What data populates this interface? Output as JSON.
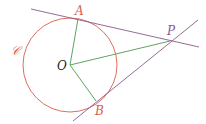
{
  "diagram": {
    "colors": {
      "circle": "#d9604a",
      "tangent": "#8a5a8a",
      "radius": "#4e9a4e",
      "label_red": "#d9604a",
      "label_dark": "#222222"
    },
    "circle": {
      "label": "𝒞",
      "cx": 70,
      "cy": 65,
      "r": 47
    },
    "points": {
      "O": {
        "label": "O",
        "x": 70,
        "y": 65
      },
      "A": {
        "label": "A",
        "x": 78,
        "y": 19
      },
      "B": {
        "label": "B",
        "x": 96,
        "y": 101
      },
      "P": {
        "label": "P",
        "x": 170,
        "y": 41
      }
    },
    "lines": [
      {
        "name": "tangent-PA",
        "from": [
          31,
          9
        ],
        "to": [
          199,
          47
        ]
      },
      {
        "name": "tangent-PB",
        "from": [
          73,
          121
        ],
        "to": [
          198,
          20
        ]
      }
    ],
    "segments": [
      {
        "name": "radius-OA",
        "from": "O",
        "to": "A"
      },
      {
        "name": "radius-OB",
        "from": "O",
        "to": "B"
      },
      {
        "name": "segment-OP",
        "from": "O",
        "to": "P"
      }
    ]
  }
}
